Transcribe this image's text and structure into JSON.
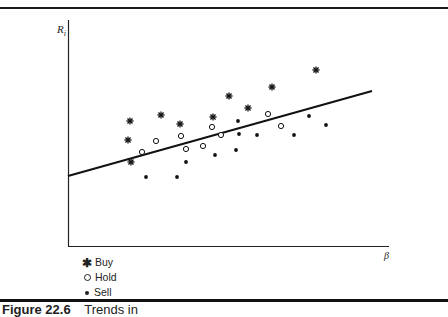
{
  "chart_data": {
    "type": "scatter",
    "title": "",
    "xlabel": "β",
    "ylabel": "R_i",
    "ylabel_display": "Ri",
    "ylabel_sub": "i",
    "grid": false,
    "legend_position": "bottom-left, below plot",
    "xlim": [
      0,
      100
    ],
    "ylim": [
      0,
      100
    ],
    "pixel_frame": {
      "x0": 68,
      "y0": 246,
      "x1": 388,
      "y1": 20
    },
    "regression_line": {
      "x": [
        0,
        95
      ],
      "y": [
        31,
        68.5
      ],
      "pixel": {
        "x1": 68,
        "y1": 176,
        "x2": 372,
        "y2": 91
      }
    },
    "series": [
      {
        "name": "Buy",
        "marker": "asterisk",
        "points_px": [
          [
            128,
            140
          ],
          [
            130,
            121
          ],
          [
            161,
            115
          ],
          [
            180,
            124
          ],
          [
            131,
            162
          ],
          [
            213,
            117
          ],
          [
            229,
            96
          ],
          [
            248,
            108
          ],
          [
            272,
            87
          ],
          [
            316,
            70
          ]
        ]
      },
      {
        "name": "Hold",
        "marker": "open-circle",
        "points_px": [
          [
            142,
            152
          ],
          [
            156,
            141
          ],
          [
            181,
            136
          ],
          [
            186,
            149
          ],
          [
            203,
            146
          ],
          [
            212,
            127
          ],
          [
            221,
            135
          ],
          [
            268,
            114
          ],
          [
            281,
            126
          ]
        ]
      },
      {
        "name": "Sell",
        "marker": "filled-dot",
        "points_px": [
          [
            146,
            177
          ],
          [
            177,
            177
          ],
          [
            186,
            162
          ],
          [
            215,
            155
          ],
          [
            236,
            150
          ],
          [
            238,
            121
          ],
          [
            239,
            134
          ],
          [
            257,
            135
          ],
          [
            294,
            135
          ],
          [
            309,
            116
          ],
          [
            326,
            125
          ]
        ]
      }
    ]
  },
  "legend": {
    "items": [
      {
        "label": "Buy",
        "marker": "✱"
      },
      {
        "label": "Hold",
        "marker": "○"
      },
      {
        "label": "Sell",
        "marker": "•"
      }
    ]
  },
  "axes": {
    "y_label": "R",
    "y_label_sub": "i",
    "x_label": "β"
  },
  "caption": {
    "label": "Figure 22.6",
    "title": "Trends in"
  }
}
